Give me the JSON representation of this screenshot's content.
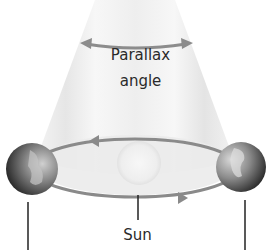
{
  "diagram": {
    "type": "parallax-illustration",
    "labels": {
      "parallax_line1": "Parallax",
      "parallax_line2": "angle",
      "sun": "Sun"
    },
    "elements": [
      {
        "name": "parallax-cone",
        "description": "Light grey cone converging upward from Earth's orbit"
      },
      {
        "name": "parallax-angle-arrow",
        "description": "Double-headed curved arrow across the cone"
      },
      {
        "name": "orbit-ellipse",
        "description": "Elliptical orbit of Earth around the Sun with direction arrows"
      },
      {
        "name": "sun",
        "description": "Pale circle at the center of the orbit"
      },
      {
        "name": "earth-left",
        "description": "Earth on the left side of the orbit"
      },
      {
        "name": "earth-right",
        "description": "Earth on the right side of the orbit"
      },
      {
        "name": "leader-lines",
        "description": "Vertical lines below left Earth, Sun, and right Earth"
      }
    ],
    "colors": {
      "cone": "#ececec",
      "cone_edge": "#dcdcdc",
      "orbit": "#8a8a8a",
      "arrow": "#8c8c8c",
      "sun": "#f2f2f2",
      "earth_dark": "#3a3a3a",
      "earth_light": "#b8b8b8",
      "text": "#2a2a2a"
    }
  }
}
